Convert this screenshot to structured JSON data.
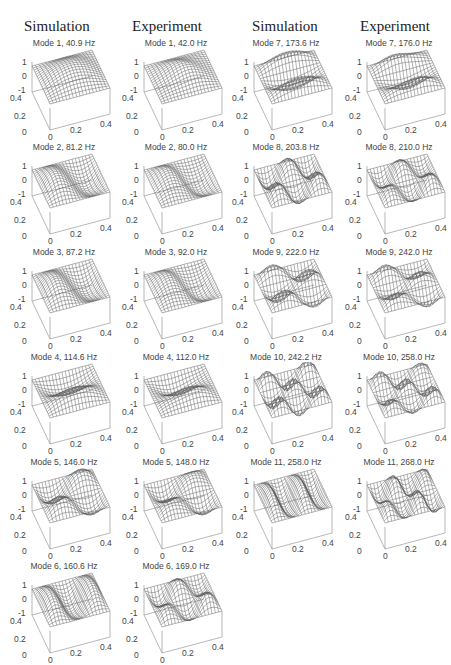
{
  "headers": {
    "left_simulation": "Simulation",
    "left_experiment": "Experiment",
    "right_simulation": "Simulation",
    "right_experiment": "Experiment"
  },
  "axes": {
    "z_ticks": [
      "1",
      "0",
      "-1"
    ],
    "y_ticks": [
      "0.4",
      "0.2",
      "0"
    ],
    "x_ticks": [
      "0",
      "0.2",
      "0.4"
    ]
  },
  "colors": {
    "mesh": "#555555",
    "axis": "#999999",
    "text": "#444444"
  },
  "chart_data": {
    "type": "surface3d-grid",
    "xlabel": "",
    "ylabel": "",
    "zlabel": "",
    "xlim": [
      0,
      0.4
    ],
    "ylim": [
      0,
      0.4
    ],
    "zlim": [
      -1,
      1
    ],
    "x_ticks": [
      0,
      0.2,
      0.4
    ],
    "y_ticks": [
      0,
      0.2,
      0.4
    ],
    "z_ticks": [
      -1,
      0,
      1
    ],
    "series": [
      {
        "name": "Simulation",
        "modes": [
          1,
          2,
          3,
          4,
          5,
          6,
          7,
          8,
          9,
          10,
          11
        ],
        "frequency_hz": [
          40.9,
          81.2,
          87.2,
          114.6,
          146.0,
          160.6,
          173.6,
          203.8,
          222.0,
          242.2,
          258.0
        ]
      },
      {
        "name": "Experiment",
        "modes": [
          1,
          2,
          3,
          4,
          5,
          6,
          7,
          8,
          9,
          10,
          11
        ],
        "frequency_hz": [
          42.0,
          80.0,
          92.0,
          112.0,
          148.0,
          169.0,
          176.0,
          210.0,
          242.0,
          258.0,
          268.0
        ]
      }
    ]
  },
  "panels": [
    {
      "id": "s1",
      "title": "Mode 1, 40.9 Hz",
      "m": 1,
      "n": 1
    },
    {
      "id": "e1",
      "title": "Mode 1, 42.0 Hz",
      "m": 1,
      "n": 1
    },
    {
      "id": "s2",
      "title": "Mode 2, 81.2 Hz",
      "m": 2,
      "n": 1
    },
    {
      "id": "e2",
      "title": "Mode 2, 80.0 Hz",
      "m": 2,
      "n": 1
    },
    {
      "id": "s3",
      "title": "Mode 3, 87.2 Hz",
      "m": 2,
      "n": 1
    },
    {
      "id": "e3",
      "title": "Mode 3, 92.0 Hz",
      "m": 2,
      "n": 1
    },
    {
      "id": "s4",
      "title": "Mode 4, 114.6 Hz",
      "m": 1,
      "n": 2
    },
    {
      "id": "e4",
      "title": "Mode 4, 112.0 Hz",
      "m": 1,
      "n": 2
    },
    {
      "id": "s5",
      "title": "Mode 5, 146.0 Hz",
      "m": 2,
      "n": 2
    },
    {
      "id": "e5",
      "title": "Mode 5, 148.0 Hz",
      "m": 2,
      "n": 2
    },
    {
      "id": "s6",
      "title": "Mode 6, 160.6 Hz",
      "m": 3,
      "n": 1
    },
    {
      "id": "e6",
      "title": "Mode 6, 169.0 Hz",
      "m": 3,
      "n": 2
    },
    {
      "id": "s7",
      "title": "Mode 7, 173.6 Hz",
      "m": 1,
      "n": 3
    },
    {
      "id": "e7",
      "title": "Mode 7, 176.0 Hz",
      "m": 1,
      "n": 3
    },
    {
      "id": "s8",
      "title": "Mode 8, 203.8 Hz",
      "m": 3,
      "n": 2
    },
    {
      "id": "e8",
      "title": "Mode 8, 210.0 Hz",
      "m": 3,
      "n": 2
    },
    {
      "id": "s9",
      "title": "Mode 9, 222.0 Hz",
      "m": 2,
      "n": 3
    },
    {
      "id": "e9",
      "title": "Mode 9, 242.0 Hz",
      "m": 2,
      "n": 3
    },
    {
      "id": "s10",
      "title": "Mode 10, 242.2 Hz",
      "m": 3,
      "n": 3
    },
    {
      "id": "e10",
      "title": "Mode 10, 258.0 Hz",
      "m": 3,
      "n": 3
    },
    {
      "id": "s11",
      "title": "Mode 11, 258.0 Hz",
      "m": 4,
      "n": 1
    },
    {
      "id": "e11",
      "title": "Mode 11, 268.0 Hz",
      "m": 4,
      "n": 2
    }
  ]
}
